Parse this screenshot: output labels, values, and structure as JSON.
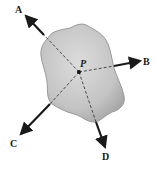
{
  "diagram": {
    "type": "free-body force diagram",
    "body": {
      "shape": "irregular-blob",
      "fill": "#c8c8c8",
      "edge": "#9a9a9a"
    },
    "point": {
      "label": "P"
    },
    "forces": [
      {
        "label": "A",
        "direction": "up-left"
      },
      {
        "label": "B",
        "direction": "right"
      },
      {
        "label": "C",
        "direction": "down-left"
      },
      {
        "label": "D",
        "direction": "down"
      }
    ],
    "colors": {
      "arrow": "#1a1a1a",
      "dashed_line": "#2a2a2a",
      "body_fill": "#c8c8c8"
    }
  }
}
